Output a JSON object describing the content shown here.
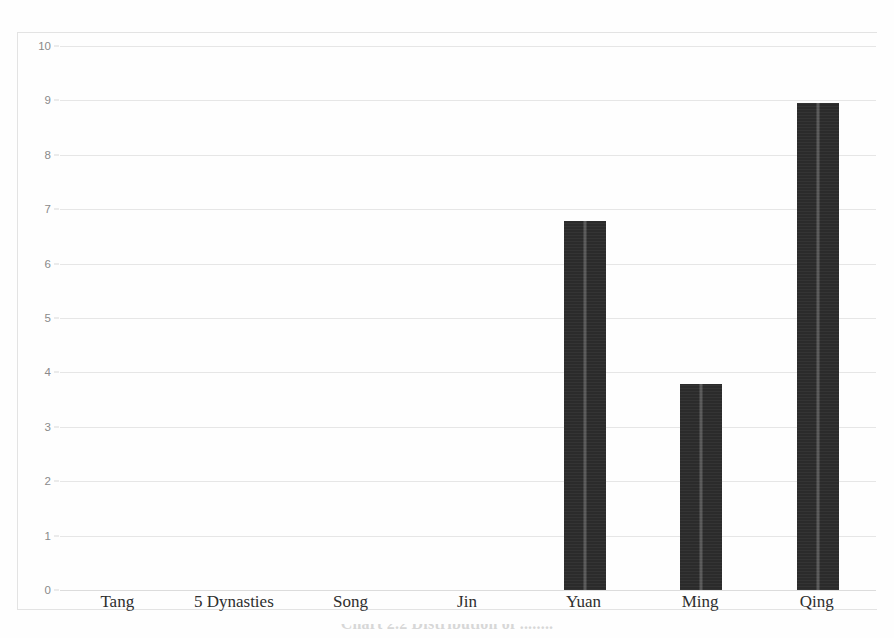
{
  "figure": {
    "top_cut_text": "........",
    "caption_partial": "Chart 2.2  Distribution of ........"
  },
  "axis": {
    "y_ticks": [
      "0",
      "1",
      "2",
      "3",
      "4",
      "5",
      "6",
      "7",
      "8",
      "9",
      "10"
    ]
  },
  "colors": {
    "bar": "#2b2b2b",
    "gridline": "#e6e6e6",
    "border": "#e3e3e3",
    "ytick_text": "#8a8a8a",
    "xlabel_text": "#2e2e2e"
  },
  "chart_data": {
    "type": "bar",
    "title": "",
    "xlabel": "",
    "ylabel": "",
    "ylim": [
      0,
      10
    ],
    "ytick_step": 1,
    "grid": true,
    "legend": false,
    "categories": [
      "Tang",
      "5 Dynasties",
      "Song",
      "Jin",
      "Yuan",
      "Ming",
      "Qing"
    ],
    "values": [
      0,
      0,
      0,
      0,
      6.78,
      3.78,
      8.95
    ]
  }
}
